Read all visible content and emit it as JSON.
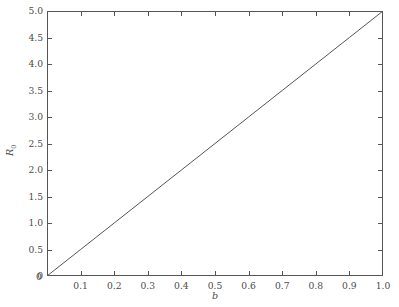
{
  "chart_data": {
    "type": "line",
    "title": "",
    "subtitle": "",
    "xlabel": "b",
    "ylabel": "R₀",
    "ylabel_base": "R",
    "ylabel_sub": "0",
    "xlim": [
      0.0,
      1.0
    ],
    "ylim": [
      0.0,
      5.0
    ],
    "grid": false,
    "legend": null,
    "annotations": [],
    "line_color": "#555555",
    "axis_color": "#555555",
    "tick_color": "#4a4a4a",
    "background_color": "#ffffff",
    "relation": "R0 = 5 * b",
    "xticks": [
      0.0,
      0.1,
      0.2,
      0.3,
      0.4,
      0.5,
      0.6,
      0.7,
      0.8,
      0.9,
      1.0
    ],
    "xtick_labels": [
      "",
      "0.1",
      "0.2",
      "0.3",
      "0.4",
      "0.5",
      "0.6",
      "0.7",
      "0.8",
      "0.9",
      "1.0"
    ],
    "yticks": [
      0.0,
      0.5,
      1.0,
      1.5,
      2.0,
      2.5,
      3.0,
      3.5,
      4.0,
      4.5,
      5.0
    ],
    "ytick_labels": [
      "0",
      "0.5",
      "1.0",
      "1.5",
      "2.0",
      "2.5",
      "3.0",
      "3.5",
      "4.0",
      "4.5",
      "5.0"
    ],
    "origin_label": "0",
    "series": [
      {
        "name": "R0 vs b",
        "x": [
          0.0,
          0.1,
          0.2,
          0.3,
          0.4,
          0.5,
          0.6,
          0.7,
          0.8,
          0.9,
          1.0
        ],
        "values": [
          0.0,
          0.5,
          1.0,
          1.5,
          2.0,
          2.5,
          3.0,
          3.5,
          4.0,
          4.5,
          5.0
        ]
      }
    ]
  }
}
